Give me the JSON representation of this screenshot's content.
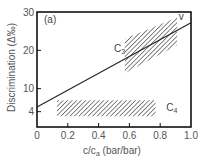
{
  "chart_data": {
    "type": "line",
    "title": "",
    "panel_label": "(a)",
    "xlabel": "c/c",
    "xlabel_sub": "a",
    "xlabel_units": " (bar/bar)",
    "ylabel": "Discrimination (Δ‰)",
    "xlim": [
      0,
      1.0
    ],
    "ylim": [
      0,
      30
    ],
    "xticks": [
      0,
      0.2,
      0.4,
      0.6,
      0.8,
      1.0
    ],
    "xtick_labels": [
      "0",
      "0.2",
      "0.4",
      "0.6",
      "0.8",
      "1.0"
    ],
    "yticks": [
      4,
      10,
      20,
      30
    ],
    "ytick_labels": [
      "4",
      "10",
      "20",
      "30"
    ],
    "grid": false,
    "series": [
      {
        "name": "model line",
        "x": [
          0,
          1.0
        ],
        "y": [
          5.2,
          27.2
        ]
      }
    ],
    "regions": [
      {
        "name": "C3",
        "label": "C",
        "label_sub": "3",
        "shape": "parallelogram",
        "points": [
          [
            0.57,
            23.0
          ],
          [
            0.91,
            28.6
          ],
          [
            0.91,
            21.3
          ],
          [
            0.57,
            14.0
          ]
        ],
        "label_at": [
          0.5,
          19.5
        ]
      },
      {
        "name": "C4",
        "label": "C",
        "label_sub": "4",
        "shape": "rectangle",
        "points": [
          [
            0.13,
            7.0
          ],
          [
            0.77,
            7.0
          ],
          [
            0.77,
            2.8
          ],
          [
            0.13,
            2.8
          ]
        ],
        "label_at": [
          0.84,
          4.2
        ]
      }
    ],
    "annotations": [
      {
        "text": "v",
        "x": 0.92,
        "y": 27.8
      }
    ]
  }
}
